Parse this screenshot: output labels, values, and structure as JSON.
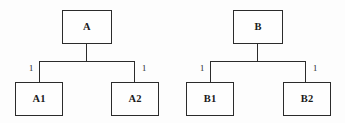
{
  "diagram": {
    "type": "tree-pair",
    "background_color": "#fdfdfd",
    "line_color": "#2b2b2b",
    "text_color": "#1a1a1a",
    "trees": [
      {
        "id": "tree-a",
        "root": {
          "label": "A"
        },
        "children": [
          {
            "label": "A1",
            "edge_label": "1"
          },
          {
            "label": "A2",
            "edge_label": "1"
          }
        ]
      },
      {
        "id": "tree-b",
        "root": {
          "label": "B"
        },
        "children": [
          {
            "label": "B1",
            "edge_label": "1"
          },
          {
            "label": "B2",
            "edge_label": "1"
          }
        ]
      }
    ]
  }
}
